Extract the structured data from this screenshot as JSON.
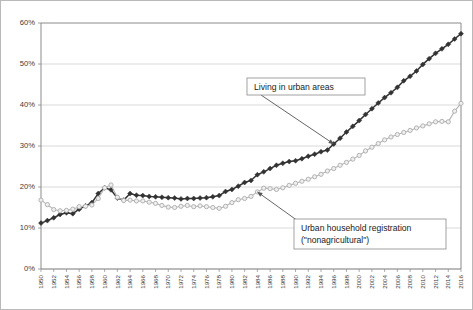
{
  "figure": {
    "border_color": "#b9b9b9",
    "background": "#ffffff"
  },
  "chart_data": {
    "type": "line",
    "title": "",
    "subtitle": "",
    "xlabel": "",
    "ylabel": "",
    "xlim": [
      1950,
      2016
    ],
    "ylim": [
      0,
      60
    ],
    "y_tick_values": [
      0,
      10,
      20,
      30,
      40,
      50,
      60
    ],
    "y_tick_labels": [
      "0%",
      "10%",
      "20%",
      "30%",
      "40%",
      "50%",
      "60%"
    ],
    "x_tick_labels": [
      "1950",
      "1952",
      "1954",
      "1956",
      "1958",
      "1960",
      "1962",
      "1964",
      "1966",
      "1968",
      "1970",
      "1972",
      "1974",
      "1976",
      "1978",
      "1980",
      "1982",
      "1984",
      "1986",
      "1988",
      "1990",
      "1992",
      "1994",
      "1996",
      "1998",
      "2000",
      "2002",
      "2004",
      "2006",
      "2008",
      "2010",
      "2012",
      "2014",
      "2016"
    ],
    "x_tick_step": 2,
    "x_label_rotation": -90,
    "grid": {
      "horizontal": true,
      "vertical": false,
      "color": "#cfcfcf"
    },
    "legend": {
      "position": "none"
    },
    "x": [
      1950,
      1951,
      1952,
      1953,
      1954,
      1955,
      1956,
      1957,
      1958,
      1959,
      1960,
      1961,
      1962,
      1963,
      1964,
      1965,
      1966,
      1967,
      1968,
      1969,
      1970,
      1971,
      1972,
      1973,
      1974,
      1975,
      1976,
      1977,
      1978,
      1979,
      1980,
      1981,
      1982,
      1983,
      1984,
      1985,
      1986,
      1987,
      1988,
      1989,
      1990,
      1991,
      1992,
      1993,
      1994,
      1995,
      1996,
      1997,
      1998,
      1999,
      2000,
      2001,
      2002,
      2003,
      2004,
      2005,
      2006,
      2007,
      2008,
      2009,
      2010,
      2011,
      2012,
      2013,
      2014,
      2015,
      2016
    ],
    "series": [
      {
        "name": "Living in urban areas",
        "marker": "filled-diamond",
        "color": "#333333",
        "values": [
          11.2,
          11.8,
          12.5,
          13.3,
          13.7,
          13.5,
          14.6,
          15.4,
          16.2,
          18.4,
          19.8,
          19.3,
          17.3,
          16.8,
          18.4,
          18.0,
          17.9,
          17.7,
          17.6,
          17.5,
          17.4,
          17.3,
          17.1,
          17.2,
          17.2,
          17.3,
          17.4,
          17.6,
          17.9,
          18.9,
          19.4,
          20.2,
          21.1,
          21.6,
          23.0,
          23.7,
          24.5,
          25.3,
          25.8,
          26.2,
          26.4,
          26.9,
          27.5,
          28.0,
          28.6,
          29.0,
          30.5,
          31.9,
          33.4,
          34.8,
          36.2,
          37.7,
          39.1,
          40.5,
          41.8,
          43.0,
          44.3,
          45.9,
          47.0,
          48.3,
          49.9,
          51.3,
          52.6,
          53.7,
          54.8,
          56.1,
          57.4
        ]
      },
      {
        "name": "Urban household registration (\"nonagricultural\")",
        "marker": "open-circle",
        "color": "#b3b3b3",
        "values": [
          16.8,
          15.7,
          14.5,
          14.2,
          14.3,
          14.6,
          15.2,
          15.3,
          15.6,
          17.2,
          19.8,
          20.5,
          17.5,
          16.7,
          16.8,
          16.6,
          16.6,
          16.3,
          16.0,
          15.5,
          15.1,
          15.0,
          15.3,
          15.5,
          15.2,
          15.4,
          15.2,
          15.0,
          14.8,
          15.3,
          16.2,
          16.9,
          17.2,
          17.7,
          18.8,
          19.7,
          19.6,
          19.4,
          19.8,
          20.4,
          20.9,
          21.4,
          21.9,
          22.5,
          23.1,
          23.9,
          24.5,
          25.3,
          26.0,
          26.8,
          27.7,
          28.8,
          29.7,
          30.6,
          31.5,
          32.2,
          32.8,
          33.3,
          33.8,
          34.4,
          34.9,
          35.4,
          35.9,
          36.0,
          35.9,
          38.5,
          40.4
        ]
      }
    ],
    "annotations": [
      {
        "id": "annotation-urban-living",
        "text": "Living in urban areas",
        "target_year": 1996,
        "target_value": 30.5,
        "box": {
          "x": 246,
          "y": 77,
          "w": 118,
          "h": 17
        }
      },
      {
        "id": "annotation-hukou",
        "text_line1": "Urban household registration",
        "text_line2": "(\"nonagricultural\")",
        "target_year": 1984,
        "target_value": 18.8,
        "box": {
          "x": 293,
          "y": 218,
          "w": 152,
          "h": 30
        }
      }
    ]
  }
}
